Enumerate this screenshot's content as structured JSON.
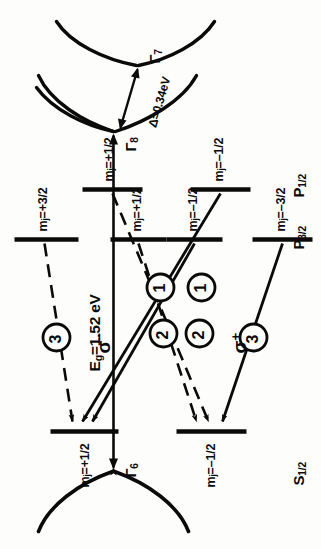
{
  "figure": {
    "type": "energy-level-diagram",
    "orientation_deg": -90
  },
  "bands": {
    "conduction": {
      "gamma_label": "Γ6",
      "term_label": "S1/2",
      "term_base": "S",
      "term_sub": "1/2",
      "gamma_base": "Γ",
      "gamma_sub": "6"
    },
    "valence_heavy_light": {
      "gamma_base": "Γ",
      "gamma_sub": "8",
      "term_base": "P",
      "term_sub": "3/2"
    },
    "valence_split_off": {
      "gamma_base": "Γ",
      "gamma_sub": "7",
      "term_base": "P",
      "term_sub": "1/2"
    }
  },
  "energies": {
    "band_gap_text": "Eg =1.52 eV",
    "band_gap_symbol": "E",
    "band_gap_sub": "g",
    "band_gap_value": "=1.52 eV",
    "split_off_text": "Δ=0.34eV",
    "band_gap_ev": 1.52,
    "split_off_ev": 0.34
  },
  "upper_levels": [
    {
      "id": "s-minus-half",
      "label_base": "m",
      "label_sub": "j",
      "label_value": "=–1/2"
    },
    {
      "id": "s-plus-half",
      "label_base": "m",
      "label_sub": "j",
      "label_value": "=+1/2"
    }
  ],
  "lower_levels_p32": [
    {
      "id": "p32-minus-3-2",
      "label_base": "m",
      "label_sub": "j",
      "label_value": "=–3/2"
    },
    {
      "id": "p32-minus-1-2",
      "label_base": "m",
      "label_sub": "j",
      "label_value": "=–1/2"
    },
    {
      "id": "p32-plus-1-2",
      "label_base": "m",
      "label_sub": "j",
      "label_value": "=+1/2"
    },
    {
      "id": "p32-plus-3-2",
      "label_base": "m",
      "label_sub": "j",
      "label_value": "=+3/2"
    }
  ],
  "lower_levels_p12": [
    {
      "id": "p12-minus-1-2",
      "label_base": "m",
      "label_sub": "j",
      "label_value": "=–1/2"
    },
    {
      "id": "p12-plus-1-2",
      "label_base": "m",
      "label_sub": "j",
      "label_value": "=+1/2"
    }
  ],
  "polarizations": [
    {
      "id": "sigma-plus",
      "base": "σ",
      "sup": "+"
    },
    {
      "id": "sigma-minus",
      "base": "σ",
      "sup": "−"
    }
  ],
  "transitions": [
    {
      "id": "t-3-sigma-plus",
      "strength": "3",
      "line": "solid",
      "from": "p32-minus-3-2",
      "to": "s-minus-half",
      "polarization": "sigma-plus"
    },
    {
      "id": "t-2-sigma-plus",
      "strength": "2",
      "line": "solid",
      "from": "p32-minus-1-2",
      "to": "s-plus-half",
      "polarization": "sigma-plus"
    },
    {
      "id": "t-2-sigma-minus",
      "strength": "2",
      "line": "dashed",
      "from": "p32-plus-1-2",
      "to": "s-minus-half",
      "polarization": "sigma-minus"
    },
    {
      "id": "t-3-sigma-minus",
      "strength": "3",
      "line": "dashed",
      "from": "p32-plus-3-2",
      "to": "s-plus-half",
      "polarization": "sigma-minus"
    },
    {
      "id": "t-1-sigma-plus",
      "strength": "1",
      "line": "solid",
      "from": "p12-minus-1-2",
      "to": "s-plus-half",
      "polarization": "sigma-plus"
    },
    {
      "id": "t-1-sigma-minus",
      "strength": "1",
      "line": "dashed",
      "from": "p12-plus-1-2",
      "to": "s-minus-half",
      "polarization": "sigma-minus"
    }
  ],
  "strength_badges": [
    "3",
    "2",
    "1",
    "1",
    "2",
    "3"
  ],
  "colors": {
    "ink": "#0a0a0a",
    "paper": "#fdfdfb"
  }
}
